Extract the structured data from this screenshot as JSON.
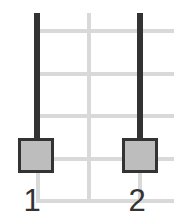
{
  "diagram": {
    "type": "slider-pair",
    "colors": {
      "grid": "#d9d9d9",
      "track": "#333333",
      "handle_fill": "#bdbdbd",
      "handle_border": "#333333",
      "label": "#333333"
    },
    "grid": {
      "horizontal_lines_y": [
        31,
        74,
        116,
        159,
        201
      ],
      "vertical_lines_x": [
        38,
        89,
        140
      ]
    },
    "sliders": [
      {
        "label": "1",
        "position": "bottom"
      },
      {
        "label": "2",
        "position": "bottom"
      }
    ]
  }
}
